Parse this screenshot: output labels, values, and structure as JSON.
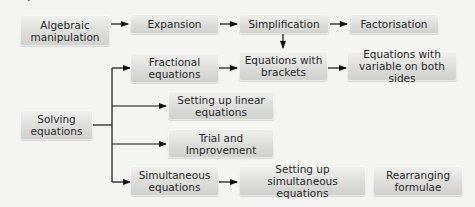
{
  "diagram": {
    "type": "flowchart",
    "heading_fragment": "g",
    "nodes": [
      {
        "id": "algebraic",
        "label": "Algebraic manipulation"
      },
      {
        "id": "expansion",
        "label": "Expansion"
      },
      {
        "id": "simplification",
        "label": "Simplification"
      },
      {
        "id": "factorisation",
        "label": "Factorisation"
      },
      {
        "id": "fractional",
        "label": "Fractional equations"
      },
      {
        "id": "brackets",
        "label": "Equations with brackets"
      },
      {
        "id": "both_sides",
        "label": "Equations with variable on both sides"
      },
      {
        "id": "solving",
        "label": "Solving equations"
      },
      {
        "id": "linear",
        "label": "Setting up linear equations"
      },
      {
        "id": "trial",
        "label": "Trial and Improvement"
      },
      {
        "id": "simultaneous",
        "label": "Simultaneous equations"
      },
      {
        "id": "setup_simultaneous",
        "label": "Setting up simultaneous equations"
      },
      {
        "id": "rearranging",
        "label": "Rearranging formulae"
      }
    ],
    "edges": [
      {
        "from": "algebraic",
        "to": "expansion"
      },
      {
        "from": "expansion",
        "to": "simplification"
      },
      {
        "from": "simplification",
        "to": "factorisation"
      },
      {
        "from": "simplification",
        "to": "brackets"
      },
      {
        "from": "fractional",
        "to": "brackets"
      },
      {
        "from": "brackets",
        "to": "both_sides"
      },
      {
        "from": "solving",
        "to": "fractional"
      },
      {
        "from": "solving",
        "to": "linear"
      },
      {
        "from": "solving",
        "to": "trial"
      },
      {
        "from": "solving",
        "to": "simultaneous"
      },
      {
        "from": "simultaneous",
        "to": "setup_simultaneous"
      }
    ],
    "colors": {
      "background": "#f4f4f2",
      "box_top": "#f1f1ef",
      "box_bottom": "#cfcfcd",
      "line": "#111111",
      "text": "#2a2a2a"
    }
  }
}
